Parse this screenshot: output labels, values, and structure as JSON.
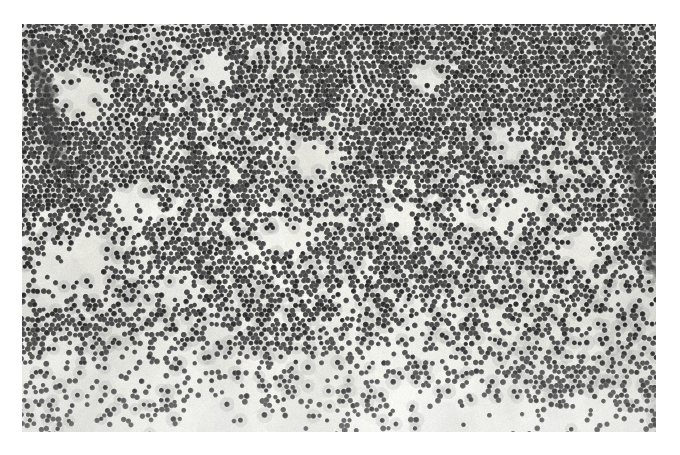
{
  "document": {
    "kind": "electron-micrograph",
    "modality": "Transmission electron microscopy (TEM), negative stain",
    "subject": "Densely packed spherical virus-like particles",
    "color_mode": "grayscale",
    "caption": "",
    "title": ""
  },
  "canvas": {
    "width": 680,
    "height": 455,
    "page_background": "#ffffff"
  },
  "micrograph": {
    "x": 22,
    "y": 24,
    "width": 634,
    "height": 408,
    "background": "#ececeb",
    "background_light": "#f2f2f1",
    "background_dark": "#e2e2e0",
    "grain_strength": 0.085,
    "vignette": 0.06,
    "border": "none"
  },
  "particles": {
    "shape": "sphere",
    "mean_diameter_px": 5.4,
    "diameter_jitter_px": 0.85,
    "core_color": "#4a4a4a",
    "core_color_dark": "#2f2f2f",
    "rim_color": "#6d6d6d",
    "halo_color": "#f4f4f3",
    "packing": "hexagonal-close-packed clusters",
    "total_count": 9200
  },
  "density_field": {
    "description": "Particle areal density decreases from top edge toward bottom edge; left and right margins retain dense streaky aggregates.",
    "gradient_axis": "vertical",
    "top_density": 1.0,
    "upper_mid_density": 0.92,
    "mid_density": 0.72,
    "lower_mid_density": 0.42,
    "bottom_density": 0.1,
    "left_edge_boost": 0.3,
    "right_edge_boost": 0.38,
    "void_patch_count": 46
  },
  "regions": [
    {
      "name": "top-dense-band",
      "y0": 0.0,
      "y1": 0.22,
      "density": 1.0,
      "note": "continuous confluent monolayer, dark streaks"
    },
    {
      "name": "upper-clusters",
      "y0": 0.22,
      "y1": 0.42,
      "density": 0.88,
      "note": "large lobed clusters with light voids"
    },
    {
      "name": "mid-transition",
      "y0": 0.42,
      "y1": 0.62,
      "density": 0.68,
      "note": "branching chains, widening background"
    },
    {
      "name": "lower-transition",
      "y0": 0.62,
      "y1": 0.82,
      "density": 0.4,
      "note": "isolated rosettes and short chains"
    },
    {
      "name": "bottom-sparse-band",
      "y0": 0.82,
      "y1": 1.0,
      "density": 0.1,
      "note": "few scattered singlets and small triplets"
    }
  ],
  "voids": [
    {
      "cx": 0.095,
      "cy": 0.175,
      "rx": 0.055,
      "ry": 0.075
    },
    {
      "cx": 0.3,
      "cy": 0.12,
      "rx": 0.035,
      "ry": 0.045
    },
    {
      "cx": 0.64,
      "cy": 0.125,
      "rx": 0.03,
      "ry": 0.04
    },
    {
      "cx": 0.465,
      "cy": 0.33,
      "rx": 0.045,
      "ry": 0.05
    },
    {
      "cx": 0.76,
      "cy": 0.3,
      "rx": 0.04,
      "ry": 0.045
    },
    {
      "cx": 0.175,
      "cy": 0.44,
      "rx": 0.042,
      "ry": 0.048
    },
    {
      "cx": 0.42,
      "cy": 0.52,
      "rx": 0.05,
      "ry": 0.045
    },
    {
      "cx": 0.6,
      "cy": 0.47,
      "rx": 0.035,
      "ry": 0.04
    },
    {
      "cx": 0.88,
      "cy": 0.56,
      "rx": 0.045,
      "ry": 0.05
    },
    {
      "cx": 0.25,
      "cy": 0.64,
      "rx": 0.038,
      "ry": 0.042
    }
  ],
  "streaks": [
    {
      "x0": 0.93,
      "y0": 0.02,
      "x1": 0.99,
      "y1": 0.3,
      "weight": 0.8
    },
    {
      "x0": 0.02,
      "y0": 0.05,
      "x1": 0.06,
      "y1": 0.35,
      "weight": 0.6
    },
    {
      "x0": 0.96,
      "y0": 0.3,
      "x1": 1.0,
      "y1": 0.62,
      "weight": 0.7
    }
  ],
  "scale_bar": {
    "present": false,
    "label": ""
  },
  "annotations": [],
  "labels": []
}
